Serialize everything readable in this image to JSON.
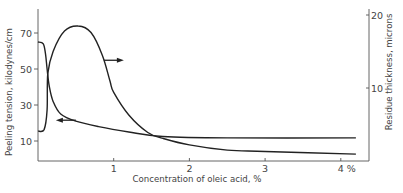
{
  "chart_data": {
    "type": "line",
    "title": "",
    "xlabel": "Concentration of oleic acid, %",
    "ylabel": "Peeling tension, kilodynes/cm",
    "y2label": "Residue thickness, microns",
    "xlim": [
      0,
      4.25
    ],
    "ylim": [
      0,
      80
    ],
    "y2lim": [
      0,
      21
    ],
    "x_ticks": [
      {
        "value": 1,
        "label": "1"
      },
      {
        "value": 2,
        "label": "2"
      },
      {
        "value": 3,
        "label": "3"
      },
      {
        "value": 4,
        "label": "4 %"
      }
    ],
    "y_ticks": [
      {
        "value": 10,
        "label": "10"
      },
      {
        "value": 30,
        "label": "30"
      },
      {
        "value": 50,
        "label": "50"
      },
      {
        "value": 70,
        "label": "70"
      }
    ],
    "y2_ticks": [
      {
        "value": 10,
        "label": "10"
      },
      {
        "value": 20,
        "label": "20"
      }
    ],
    "grid": false,
    "legend": "none (arrows indicate axis for each curve)",
    "series": [
      {
        "name": "Peeling tension",
        "axis": "left",
        "unit": "kilodynes/cm",
        "arrow": {
          "direction": "left",
          "at_x": 0.5
        },
        "x": [
          0,
          0.07,
          0.1,
          0.12,
          0.15,
          0.2,
          0.3,
          0.5,
          0.8,
          1.2,
          1.65,
          2.5,
          4.2
        ],
        "values": [
          65,
          64,
          58,
          50,
          40,
          32,
          25,
          21,
          18,
          15,
          12.5,
          11.7,
          11.7
        ]
      },
      {
        "name": "Residue thickness",
        "axis": "right",
        "unit": "microns",
        "arrow": {
          "direction": "right",
          "at_x": 0.87
        },
        "x": [
          0,
          0.08,
          0.12,
          0.13,
          0.2,
          0.35,
          0.53,
          0.7,
          0.85,
          0.95,
          1.0,
          1.2,
          1.45,
          1.65,
          2.0,
          2.5,
          3.0,
          4.2
        ],
        "values": [
          4.1,
          4.3,
          7,
          12,
          15,
          17.8,
          18.5,
          17.6,
          14.5,
          11,
          9.4,
          6.3,
          3.9,
          3.1,
          2.2,
          1.5,
          1.3,
          0.95
        ]
      }
    ]
  },
  "colors": {
    "line": "#222222",
    "axis": "#555555",
    "text": "#444444",
    "background": "#ffffff"
  }
}
